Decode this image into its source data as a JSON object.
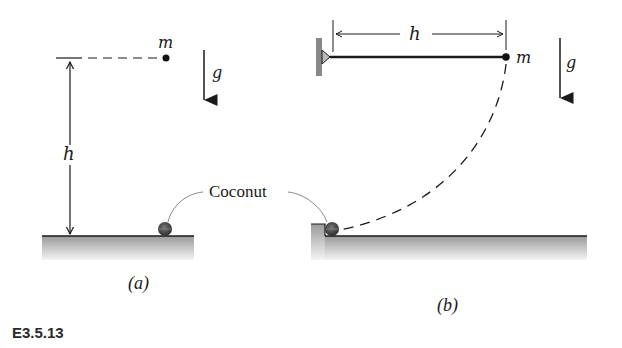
{
  "figure": {
    "id": "E3.5.13",
    "shared_label": "Coconut",
    "panels": [
      {
        "tag": "(a)",
        "mass_label": "m",
        "gravity_label": "g",
        "height_label": "h",
        "description": "mass dropped from height h above coconut"
      },
      {
        "tag": "(b)",
        "mass_label": "m",
        "gravity_label": "g",
        "length_label": "h",
        "description": "mass on rod of length h pivoted at wall, swings down along dashed arc to coconut"
      }
    ]
  },
  "colors": {
    "ink": "#1a1a1a",
    "ground_top": "#9a9a9a",
    "ground_bottom": "#f2f2f2",
    "coconut": "#4a4a4a"
  }
}
